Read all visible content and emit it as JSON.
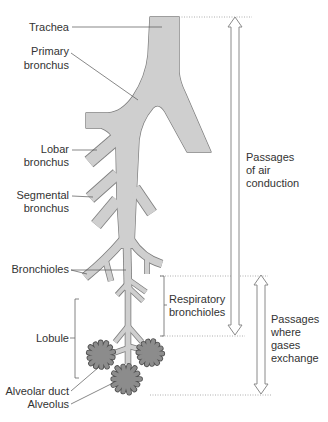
{
  "figure": {
    "labels": {
      "trachea": "Trachea",
      "primary_bronchus": [
        "Primary",
        "bronchus"
      ],
      "lobar_bronchus": [
        "Lobar",
        "bronchus"
      ],
      "segmental_bronchus": [
        "Segmental",
        "bronchus"
      ],
      "bronchioles": "Bronchioles",
      "lobule": "Lobule",
      "alveolar_duct": "Alveolar duct",
      "alveolus": "Alveolus",
      "respiratory_bronchioles": [
        "Respiratory",
        "bronchioles"
      ]
    },
    "zones": {
      "air_conduction": [
        "Passages",
        "of air",
        "conduction"
      ],
      "gas_exchange": [
        "Passages",
        "where",
        "gases",
        "exchange"
      ]
    },
    "colors": {
      "airway_fill": "#cfcfcf",
      "airway_outline": "#7d7d7d",
      "alveoli_fill": "#8c8c8c",
      "alveoli_outline": "#505050",
      "text": "#333333",
      "arrow_outline": "#8a8a8a"
    }
  }
}
